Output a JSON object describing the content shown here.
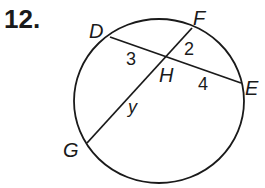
{
  "problem": {
    "number_label": "12."
  },
  "diagram": {
    "shape": "circle with two intersecting chords DE and FG meeting at H",
    "stroke_color": "#1a1a1a",
    "points": {
      "D": "D",
      "E": "E",
      "F": "F",
      "G": "G",
      "H": "H"
    },
    "segment_labels": {
      "DH": "3",
      "FH": "2",
      "HE": "4",
      "HG": "y"
    }
  }
}
